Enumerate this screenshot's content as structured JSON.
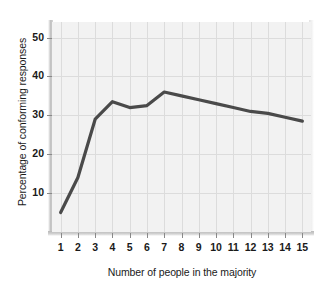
{
  "chart_data": {
    "type": "line",
    "title": "",
    "xlabel": "Number of people in the majority",
    "ylabel": "Percentage of conforming responses",
    "x": [
      1,
      2,
      3,
      4,
      5,
      6,
      7,
      8,
      9,
      10,
      11,
      12,
      13,
      14,
      15
    ],
    "values": [
      5,
      14,
      29,
      33.5,
      32,
      32.5,
      36,
      35,
      34,
      33,
      32,
      31,
      30.5,
      29.5,
      28.5
    ],
    "series": [
      {
        "name": "Percentage of conforming responses",
        "values": [
          5,
          14,
          29,
          33.5,
          32,
          32.5,
          36,
          35,
          34,
          33,
          32,
          31,
          30.5,
          29.5,
          28.5
        ]
      }
    ],
    "xtick_labels": [
      "1",
      "2",
      "3",
      "4",
      "5",
      "6",
      "7",
      "8",
      "9",
      "10",
      "11",
      "12",
      "13",
      "14",
      "15"
    ],
    "ytick_labels": [
      "10",
      "20",
      "30",
      "40",
      "50"
    ],
    "ytick_values": [
      10,
      20,
      30,
      40,
      50
    ],
    "xlim": [
      0.5,
      15.5
    ],
    "ylim": [
      0,
      54
    ],
    "grid": true,
    "legend": "none",
    "line_color": "#4a4a4a",
    "plot_background": "#f2f2f2",
    "grid_color": "#dcdcdc",
    "text_color": "#1a1a1a"
  }
}
